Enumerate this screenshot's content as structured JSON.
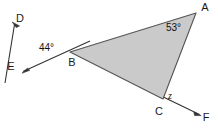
{
  "diagram": {
    "type": "geometry-triangle-with-transversals",
    "background_color": "#ffffff",
    "triangle": {
      "fill_color": "#cacaca",
      "stroke_color": "#555555",
      "vertices": [
        "A",
        "B",
        "C"
      ]
    },
    "line_color": "#333333",
    "points": {
      "A": {
        "label": "A",
        "x": 196,
        "y": 13,
        "label_x": 205,
        "label_y": 11
      },
      "B": {
        "label": "B",
        "x": 70,
        "y": 52,
        "label_x": 72,
        "label_y": 66
      },
      "C": {
        "label": "C",
        "x": 163,
        "y": 99,
        "label_x": 159,
        "label_y": 115
      },
      "D": {
        "label": "D",
        "x": 13,
        "y": 23,
        "label_x": 20,
        "label_y": 22
      },
      "E": {
        "label": "E",
        "x": 24,
        "y": 72,
        "label_x": 11,
        "label_y": 70
      },
      "F": {
        "label": "F",
        "x": 200,
        "y": 115,
        "label_x": 206,
        "label_y": 121
      }
    },
    "angles": [
      {
        "name": "angle-at-B",
        "value": "44°",
        "x": 39,
        "y": 51,
        "style": "degrees"
      },
      {
        "name": "angle-at-A",
        "value": "53°",
        "x": 166,
        "y": 31,
        "style": "degrees"
      },
      {
        "name": "angle-at-C",
        "value": "z",
        "x": 168,
        "y": 99,
        "style": "variable"
      }
    ],
    "segments": [
      {
        "name": "ray-D-through-B",
        "from": "D",
        "to": "extended-lower-left",
        "arrow_at": "D"
      },
      {
        "name": "ray-E-through-B",
        "from": "E",
        "to": "extended-upper-right",
        "arrow_at": "E"
      },
      {
        "name": "ray-C-to-F",
        "from": "C",
        "to": "F",
        "arrow_at": "F"
      },
      {
        "name": "side-A-B",
        "from": "A",
        "to": "B",
        "arrow_at": "none"
      },
      {
        "name": "side-B-C",
        "from": "B",
        "to": "C",
        "arrow_at": "none"
      },
      {
        "name": "side-A-C",
        "from": "A",
        "to": "C",
        "arrow_at": "none"
      }
    ]
  }
}
